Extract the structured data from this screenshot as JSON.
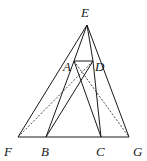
{
  "diagram": {
    "type": "geometry",
    "points": {
      "E": {
        "x": 87,
        "y": 25,
        "label": "E",
        "lx": 81,
        "ly": 17
      },
      "A": {
        "x": 74,
        "y": 61,
        "label": "A",
        "lx": 63,
        "ly": 71
      },
      "D": {
        "x": 93,
        "y": 61,
        "label": "D",
        "lx": 95,
        "ly": 71
      },
      "F": {
        "x": 18,
        "y": 137,
        "label": "F",
        "lx": 4,
        "ly": 156
      },
      "B": {
        "x": 46,
        "y": 137,
        "label": "B",
        "lx": 41,
        "ly": 156
      },
      "C": {
        "x": 101,
        "y": 137,
        "label": "C",
        "lx": 96,
        "ly": 156
      },
      "G": {
        "x": 129,
        "y": 137,
        "label": "G",
        "lx": 133,
        "ly": 156
      }
    },
    "segments": [
      {
        "from": "E",
        "to": "F",
        "style": "solid"
      },
      {
        "from": "E",
        "to": "G",
        "style": "solid"
      },
      {
        "from": "F",
        "to": "G",
        "style": "solid"
      },
      {
        "from": "A",
        "to": "D",
        "style": "solid"
      },
      {
        "from": "E",
        "to": "A",
        "style": "solid"
      },
      {
        "from": "E",
        "to": "D",
        "style": "solid"
      },
      {
        "from": "A",
        "to": "B",
        "style": "solid"
      },
      {
        "from": "D",
        "to": "C",
        "style": "solid"
      },
      {
        "from": "A",
        "to": "C",
        "style": "solid"
      },
      {
        "from": "D",
        "to": "B",
        "style": "solid"
      },
      {
        "from": "F",
        "to": "D",
        "style": "dashed"
      },
      {
        "from": "A",
        "to": "G",
        "style": "dashed"
      }
    ]
  }
}
